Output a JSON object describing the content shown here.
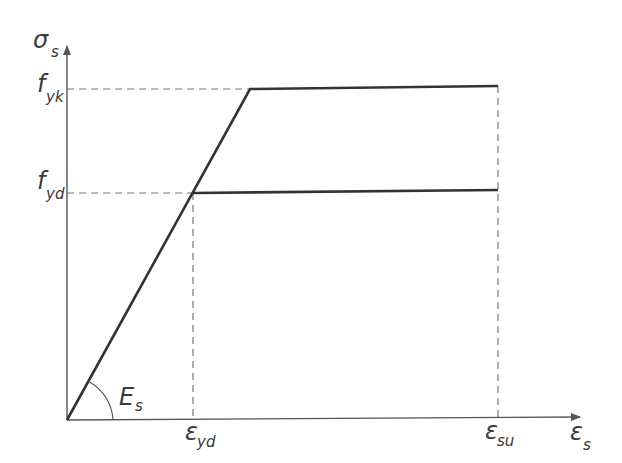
{
  "diagram": {
    "axes": {
      "y_label": {
        "symbol": "σ",
        "subscript": "s"
      },
      "x_label": {
        "symbol": "ε",
        "subscript": "s"
      }
    },
    "stress_levels": [
      {
        "symbol": "f",
        "subscript": "yk"
      },
      {
        "symbol": "f",
        "subscript": "yd"
      }
    ],
    "strain_levels": [
      {
        "symbol": "ε",
        "subscript": "yd"
      },
      {
        "symbol": "ε",
        "subscript": "su"
      }
    ],
    "modulus_label": {
      "symbol": "E",
      "subscript": "s"
    },
    "colors": {
      "curve": "#333333",
      "axis": "#555555",
      "dashed": "#777777",
      "text": "#3a3a3a"
    }
  }
}
